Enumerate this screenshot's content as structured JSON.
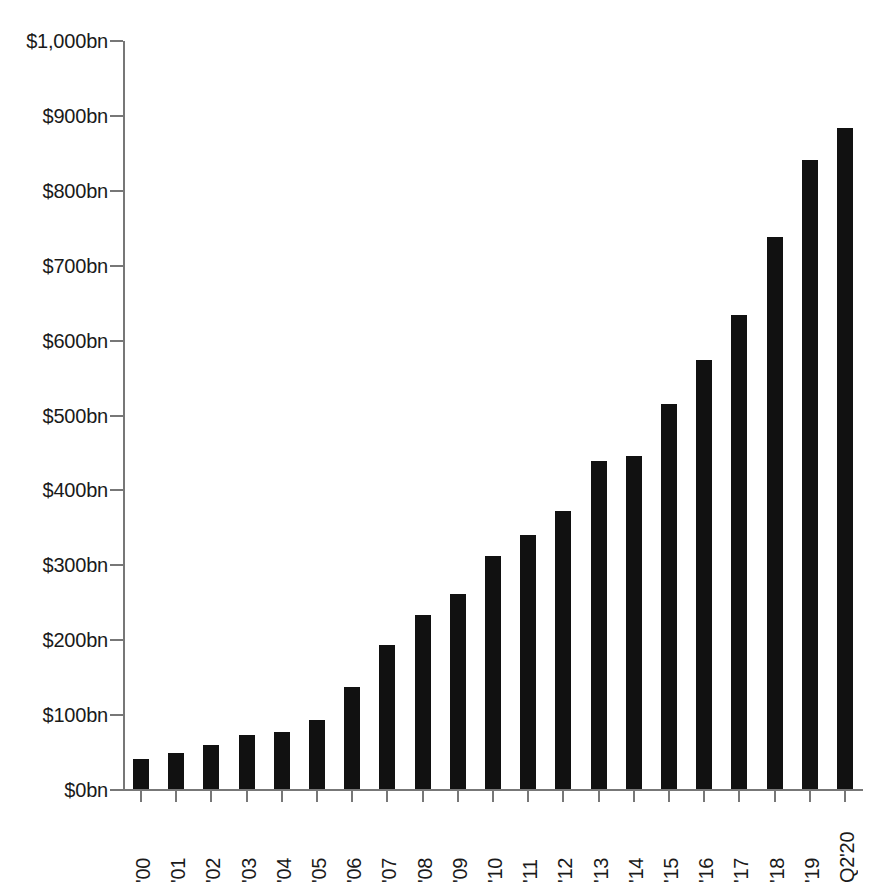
{
  "chart_data": {
    "type": "bar",
    "title": "",
    "subtitle": "",
    "xlabel": "",
    "ylabel": "",
    "categories": [
      "'00",
      "'01",
      "'02",
      "'03",
      "'04",
      "'05",
      "'06",
      "'07",
      "'08",
      "'09",
      "'10",
      "'11",
      "'12",
      "'13",
      "'14",
      "'15",
      "'16",
      "'17",
      "'18",
      "'19",
      "Q2'20"
    ],
    "values": [
      42,
      50,
      60,
      74,
      78,
      94,
      138,
      193,
      233,
      262,
      312,
      341,
      373,
      439,
      446,
      515,
      574,
      634,
      739,
      841,
      884
    ],
    "series": [
      {
        "name": "",
        "values": [
          42,
          50,
          60,
          74,
          78,
          94,
          138,
          193,
          233,
          262,
          312,
          341,
          373,
          439,
          446,
          515,
          574,
          634,
          739,
          841,
          884
        ]
      }
    ],
    "ylim": [
      0,
      1000
    ],
    "y_ticks": [
      0,
      100,
      200,
      300,
      400,
      500,
      600,
      700,
      800,
      900,
      1000
    ],
    "y_tick_labels": [
      "$0bn",
      "$100bn",
      "$200bn",
      "$300bn",
      "$400bn",
      "$500bn",
      "$600bn",
      "$700bn",
      "$800bn",
      "$900bn",
      "$1,000bn"
    ],
    "grid": false,
    "legend": null,
    "legend_position": "none",
    "bar_color": "#111111",
    "background_color": "#ffffff",
    "axis_color": "#777777",
    "text_color": "#1a1a1a",
    "annotations": []
  }
}
